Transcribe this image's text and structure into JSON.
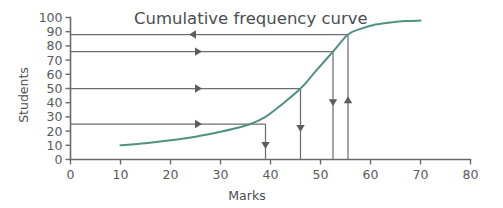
{
  "chart_data": {
    "type": "line",
    "title": "Cumulative frequency curve",
    "xlabel": "Marks",
    "ylabel": "Students",
    "xlim": [
      0,
      80
    ],
    "ylim": [
      0,
      100
    ],
    "grid": false,
    "legend": "none",
    "x_ticks": [
      0,
      10,
      20,
      30,
      40,
      50,
      60,
      70,
      80
    ],
    "x_tick_labels": [
      "0",
      "10",
      "20",
      "30",
      "40",
      "50",
      "60",
      "70",
      "80"
    ],
    "y_ticks": [
      0,
      10,
      20,
      30,
      40,
      50,
      60,
      70,
      80,
      90,
      100
    ],
    "y_tick_labels": [
      "0",
      "10",
      "20",
      "30",
      "40",
      "50",
      "60",
      "70",
      "80",
      "90",
      "100"
    ],
    "series": [
      {
        "name": "Cumulative frequency",
        "color": "#4f9280",
        "x": [
          10,
          15,
          20,
          25,
          30,
          33,
          36,
          39,
          42,
          46,
          49,
          52.5,
          55.5,
          58,
          61,
          64,
          67,
          70
        ],
        "values": [
          10,
          11.5,
          13.5,
          16,
          19.5,
          22,
          25,
          30,
          38,
          50,
          62,
          76,
          88,
          92,
          95,
          96.5,
          97.5,
          97.8
        ]
      }
    ],
    "annotations": [
      {
        "name": "construction-line-88",
        "kind": "horizontal-read-line",
        "y": 88,
        "x_from": 0,
        "x_to": 55.5,
        "arrow_direction": "left",
        "arrow_at_x": 25
      },
      {
        "name": "construction-line-76",
        "kind": "horizontal-read-line",
        "y": 76,
        "x_from": 0,
        "x_to": 52.5,
        "arrow_direction": "right",
        "arrow_at_x": 25
      },
      {
        "name": "construction-line-50",
        "kind": "horizontal-read-line",
        "y": 50,
        "x_from": 0,
        "x_to": 46,
        "arrow_direction": "right",
        "arrow_at_x": 25
      },
      {
        "name": "construction-line-25",
        "kind": "horizontal-read-line",
        "y": 25,
        "x_from": 0,
        "x_to": 39,
        "arrow_direction": "right",
        "arrow_at_x": 25
      },
      {
        "name": "construction-line-x39",
        "kind": "vertical-read-line",
        "x": 39,
        "y_from": 0,
        "y_to": 25,
        "arrow_direction": "down",
        "arrow_at_y": 12
      },
      {
        "name": "construction-line-x46",
        "kind": "vertical-read-line",
        "x": 46,
        "y_from": 0,
        "y_to": 50,
        "arrow_direction": "down",
        "arrow_at_y": 24
      },
      {
        "name": "construction-line-x52",
        "kind": "vertical-read-line",
        "x": 52.5,
        "y_from": 0,
        "y_to": 76,
        "arrow_direction": "down",
        "arrow_at_y": 42
      },
      {
        "name": "construction-line-x55",
        "kind": "vertical-read-line",
        "x": 55.5,
        "y_from": 0,
        "y_to": 88,
        "arrow_direction": "up",
        "arrow_at_y": 40
      }
    ]
  }
}
